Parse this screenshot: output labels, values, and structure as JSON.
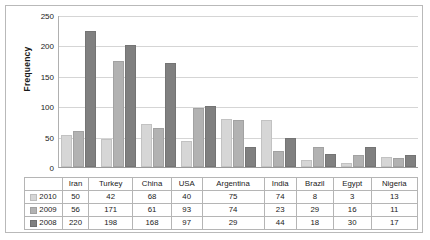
{
  "chart_data": {
    "type": "bar",
    "title": "",
    "xlabel": "",
    "ylabel": "Frequency",
    "ylim": [
      0,
      250
    ],
    "yticks": [
      250,
      200,
      150,
      100,
      50,
      0
    ],
    "grid": true,
    "legend_position": "table-left",
    "categories": [
      "Iran",
      "Turkey",
      "China",
      "USA",
      "Argentina",
      "India",
      "Brazil",
      "Egypt",
      "Nigeria"
    ],
    "series": [
      {
        "name": "2010",
        "color": "#d6d6d6",
        "values": [
          50,
          42,
          68,
          40,
          75,
          74,
          8,
          3,
          13
        ]
      },
      {
        "name": "2009",
        "color": "#b2b2b2",
        "values": [
          56,
          171,
          61,
          93,
          74,
          23,
          29,
          16,
          11
        ]
      },
      {
        "name": "2008",
        "color": "#808080",
        "values": [
          220,
          198,
          168,
          97,
          29,
          44,
          18,
          30,
          17
        ]
      }
    ]
  },
  "table": {
    "corner_label": "",
    "columns": [
      "Iran",
      "Turkey",
      "China",
      "USA",
      "Argentina",
      "India",
      "Brazil",
      "Egypt",
      "Nigeria"
    ],
    "rows": [
      {
        "label": "2010",
        "swatch": "sw2010",
        "values": [
          "50",
          "42",
          "68",
          "40",
          "75",
          "74",
          "8",
          "3",
          "13"
        ]
      },
      {
        "label": "2009",
        "swatch": "sw2009",
        "values": [
          "56",
          "171",
          "61",
          "93",
          "74",
          "23",
          "29",
          "16",
          "11"
        ]
      },
      {
        "label": "2008",
        "swatch": "sw2008",
        "values": [
          "220",
          "198",
          "168",
          "97",
          "29",
          "44",
          "18",
          "30",
          "17"
        ]
      }
    ]
  }
}
